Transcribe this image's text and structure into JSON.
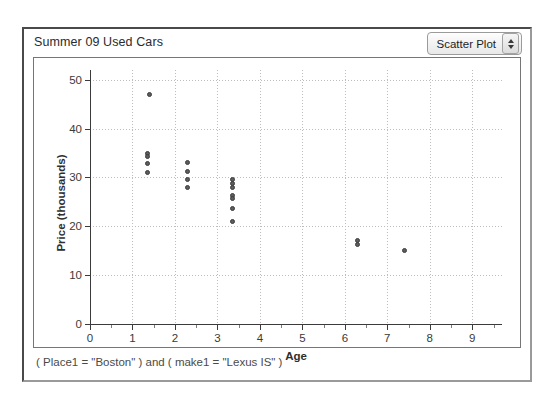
{
  "window": {
    "doc_title": "Summer 09 Used Cars"
  },
  "plot_type_popup": {
    "selected": "Scatter Plot",
    "stepper_up_icon": "triangle-up-icon",
    "stepper_down_icon": "triangle-down-icon"
  },
  "footer": {
    "formula": "( Place1 = \"Boston\" ) and ( make1 = \"Lexus IS\" )"
  },
  "chart_data": {
    "type": "scatter",
    "title": "Summer 09 Used Cars",
    "xlabel": "Age",
    "ylabel": "Price (thousands)",
    "xlim": [
      0,
      9.7
    ],
    "ylim": [
      0,
      52
    ],
    "grid": true,
    "legend": "none",
    "x_major_ticks": [
      0,
      1,
      2,
      3,
      4,
      5,
      6,
      7,
      8,
      9
    ],
    "x_minor_tick_step": 0.5,
    "y_major_ticks": [
      0,
      10,
      20,
      30,
      40,
      50
    ],
    "marker": {
      "shape": "circle",
      "fill": "#5c5c5c",
      "edge": "#3c3c3c",
      "size_px": 5
    },
    "points": [
      {
        "x": 1.4,
        "y": 47.0
      },
      {
        "x": 1.35,
        "y": 35.0
      },
      {
        "x": 1.35,
        "y": 34.3
      },
      {
        "x": 1.35,
        "y": 32.8
      },
      {
        "x": 1.35,
        "y": 31.0
      },
      {
        "x": 2.3,
        "y": 33.0
      },
      {
        "x": 2.3,
        "y": 31.3
      },
      {
        "x": 2.3,
        "y": 29.6
      },
      {
        "x": 2.3,
        "y": 28.0
      },
      {
        "x": 3.35,
        "y": 29.6
      },
      {
        "x": 3.35,
        "y": 28.8
      },
      {
        "x": 3.35,
        "y": 28.0
      },
      {
        "x": 3.35,
        "y": 26.4
      },
      {
        "x": 3.35,
        "y": 25.6
      },
      {
        "x": 3.35,
        "y": 23.6
      },
      {
        "x": 3.35,
        "y": 21.0
      },
      {
        "x": 6.3,
        "y": 17.1
      },
      {
        "x": 6.3,
        "y": 16.2
      },
      {
        "x": 7.4,
        "y": 15.0
      }
    ]
  }
}
